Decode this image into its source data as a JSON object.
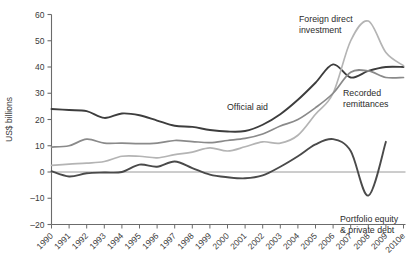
{
  "chart_data": {
    "type": "line",
    "title": "",
    "xlabel": "",
    "ylabel": "US$ billions",
    "ylim": [
      -20,
      60
    ],
    "yticks": [
      -20,
      -10,
      0,
      10,
      20,
      30,
      40,
      50,
      60
    ],
    "ytick_labels": [
      "–20",
      "–10",
      "0",
      "10",
      "20",
      "30",
      "40",
      "50",
      "60"
    ],
    "grid": false,
    "zero_line": true,
    "legend_position": "inline-annotations",
    "categories": [
      "1990",
      "1991",
      "1992",
      "1993",
      "1994",
      "1995",
      "1996",
      "1997",
      "1998",
      "1999",
      "2000",
      "2001",
      "2002",
      "2003",
      "2004",
      "2005",
      "2006",
      "2007",
      "2008",
      "2009",
      "2010e"
    ],
    "series": [
      {
        "name": "Official aid",
        "color": "#3d3d3d",
        "width": 1.9,
        "values": [
          24.0,
          23.6,
          23.2,
          20.6,
          22.3,
          21.6,
          19.6,
          17.6,
          17.2,
          16.0,
          15.4,
          15.6,
          18.0,
          22.0,
          27.5,
          34.0,
          41.0,
          36.0,
          38.5,
          40.0,
          40.0
        ],
        "end_index": 20
      },
      {
        "name": "Foreign direct investment",
        "color": "#b4b4b4",
        "width": 1.7,
        "values": [
          2.5,
          3.0,
          3.4,
          4.0,
          6.0,
          6.0,
          5.4,
          6.6,
          7.6,
          9.2,
          8.0,
          9.6,
          11.5,
          11.0,
          14.0,
          22.0,
          30.0,
          50.0,
          57.5,
          45.5,
          40.5
        ],
        "end_index": 20
      },
      {
        "name": "Recorded remittances",
        "color": "#8a8a8a",
        "width": 1.7,
        "values": [
          9.5,
          10.0,
          12.5,
          11.0,
          11.0,
          10.8,
          11.0,
          12.0,
          11.6,
          11.2,
          12.0,
          12.8,
          14.5,
          17.5,
          20.0,
          24.5,
          30.0,
          38.0,
          38.5,
          36.0,
          36.0
        ],
        "end_index": 20
      },
      {
        "name": "Portfolio equity & private debt",
        "color": "#4a4a4a",
        "width": 1.9,
        "values": [
          0.3,
          -1.7,
          -0.5,
          -0.2,
          0.0,
          2.8,
          2.0,
          4.0,
          1.5,
          -1.0,
          -2.0,
          -2.4,
          -1.3,
          2.0,
          6.0,
          10.5,
          12.5,
          8.0,
          -9.0,
          11.5,
          null
        ],
        "end_index": 19
      }
    ],
    "annotations": [
      {
        "text_line1": "Official aid",
        "text_line2": "",
        "x": 227,
        "y": 110
      },
      {
        "text_line1": "Foreign direct",
        "text_line2": "investment",
        "x": 299,
        "y": 22
      },
      {
        "text_line1": "Recorded",
        "text_line2": "remittances",
        "x": 343,
        "y": 96
      },
      {
        "text_line1": "Portfolio equity",
        "text_line2": "& private debt",
        "x": 340,
        "y": 222
      }
    ]
  }
}
